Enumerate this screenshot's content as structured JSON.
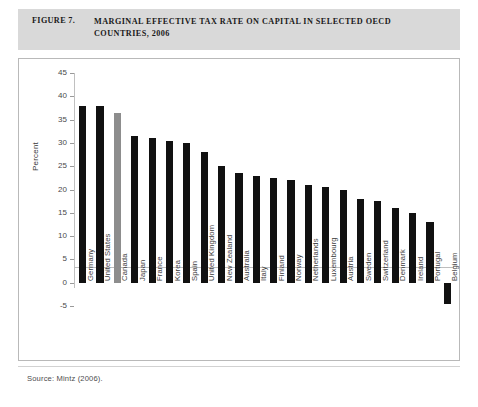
{
  "figure": {
    "number_label": "FIGURE 7.",
    "title": "MARGINAL EFFECTIVE TAX RATE ON CAPITAL IN SELECTED OECD COUNTRIES, 2006",
    "source": "Source: Mintz (2006)."
  },
  "colors": {
    "header_band": "#d9d9d9",
    "bar_default": "#111111",
    "bar_highlight": "#8d8d8d",
    "axis": "#bdbdbd"
  },
  "chart_data": {
    "type": "bar",
    "title": "MARGINAL EFFECTIVE TAX RATE ON CAPITAL IN SELECTED OECD COUNTRIES, 2006",
    "xlabel": "",
    "ylabel": "Percent",
    "ylim": [
      -5,
      45
    ],
    "yticks": [
      45,
      40,
      35,
      30,
      25,
      20,
      15,
      10,
      5,
      0,
      -5
    ],
    "grid": false,
    "legend": "none",
    "highlight_category": "Canada",
    "categories": [
      "Germany",
      "United States",
      "Canada",
      "Japan",
      "France",
      "Korea",
      "Spain",
      "United Kingdom",
      "New Zealand",
      "Australia",
      "Italy",
      "Finland",
      "Norway",
      "Netherlands",
      "Luxembourg",
      "Austria",
      "Sweden",
      "Switzerland",
      "Denmark",
      "Ireland",
      "Portugal",
      "Belgium"
    ],
    "values": [
      38.0,
      38.0,
      36.5,
      31.5,
      31.0,
      30.5,
      30.0,
      28.0,
      25.0,
      23.5,
      23.0,
      22.5,
      22.0,
      21.0,
      20.5,
      20.0,
      18.0,
      17.5,
      16.0,
      15.0,
      13.0,
      -4.5
    ]
  }
}
